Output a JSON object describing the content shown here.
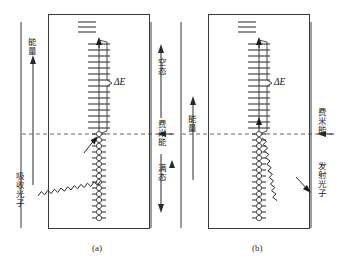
{
  "figure": {
    "type": "energy-band-diagram",
    "panels": [
      {
        "id": "a",
        "caption": "(a)",
        "process": "absorption",
        "labels": {
          "energy_axis": "能量",
          "photon": "吸收光子",
          "empty_states": "空态",
          "fermi_level": "费米能",
          "filled_states": "满态",
          "transition_gap": "ΔE"
        },
        "levels": {
          "top_detached_count": 3,
          "empty_ladder_count": 16,
          "filled_hole_count": 15
        }
      },
      {
        "id": "b",
        "caption": "(b)",
        "process": "emission",
        "labels": {
          "energy_axis": "能量",
          "photon": "发射光子",
          "fermi_level": "费米能",
          "transition_gap": "ΔE"
        },
        "levels": {
          "top_detached_count": 3,
          "empty_ladder_count": 16,
          "filled_hole_count": 15
        }
      }
    ],
    "shared": {
      "middle_energy_axis": "能量"
    },
    "colors": {
      "stroke": "#3a3a3a",
      "dashed_fermi": "#555555",
      "text": "#1f1f1f",
      "background": "#ffffff"
    }
  }
}
